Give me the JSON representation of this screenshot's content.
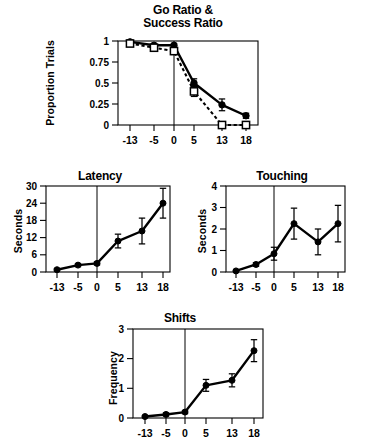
{
  "figure": {
    "background": "#ffffff",
    "ink_color": "#000000"
  },
  "chart_data": [
    {
      "id": "go-success-ratio",
      "type": "line",
      "title": "Go Ratio &\nSuccess Ratio",
      "title_line1": "Go Ratio &",
      "title_line2": "Success Ratio",
      "xlabel": "",
      "ylabel": "Proportion Trials",
      "x": [
        -13,
        -5,
        0,
        5,
        13,
        18
      ],
      "xtick_labels": [
        "-13",
        "-5",
        "0",
        "5",
        "13",
        "18"
      ],
      "ytick_labels": [
        "0",
        "0.25",
        "0.5",
        "0.75",
        "1"
      ],
      "ytick_values": [
        0,
        0.25,
        0.5,
        0.75,
        1
      ],
      "ylim": [
        0,
        1
      ],
      "grid": false,
      "legend": "none",
      "vertical_reference_x": 0,
      "series": [
        {
          "name": "Go Ratio",
          "marker": "filled-circle",
          "line": "solid",
          "values": [
            0.99,
            0.95,
            0.95,
            0.5,
            0.24,
            0.11
          ],
          "errors": [
            0.01,
            0.02,
            0.02,
            0.05,
            0.07,
            0.03
          ]
        },
        {
          "name": "Success Ratio",
          "marker": "open-square",
          "line": "dashed",
          "values": [
            0.97,
            0.92,
            0.88,
            0.4,
            0.0,
            0.0
          ],
          "errors": [
            0.02,
            0.03,
            0.04,
            0.06,
            0.0,
            0.0
          ]
        }
      ]
    },
    {
      "id": "latency",
      "type": "line",
      "title": "Latency",
      "xlabel": "",
      "ylabel": "Seconds",
      "x": [
        -13,
        -5,
        0,
        5,
        13,
        18
      ],
      "xtick_labels": [
        "-13",
        "-5",
        "0",
        "5",
        "13",
        "18"
      ],
      "ytick_labels": [
        "0",
        "6",
        "12",
        "18",
        "24",
        "30"
      ],
      "ytick_values": [
        0,
        6,
        12,
        18,
        24,
        30
      ],
      "ylim": [
        0,
        30
      ],
      "grid": false,
      "legend": "none",
      "vertical_reference_x": 0,
      "series": [
        {
          "name": "Latency",
          "marker": "filled-circle",
          "line": "solid",
          "values": [
            0.8,
            2.4,
            3.0,
            10.8,
            14.3,
            24.0
          ],
          "errors": [
            0.4,
            0.5,
            0.5,
            2.4,
            4.5,
            5.2
          ]
        }
      ]
    },
    {
      "id": "touching",
      "type": "line",
      "title": "Touching",
      "xlabel": "",
      "ylabel": "Seconds",
      "x": [
        -13,
        -5,
        0,
        5,
        13,
        18
      ],
      "xtick_labels": [
        "-13",
        "-5",
        "0",
        "5",
        "13",
        "18"
      ],
      "ytick_labels": [
        "0",
        "1",
        "2",
        "3",
        "4"
      ],
      "ytick_values": [
        0,
        1,
        2,
        3,
        4
      ],
      "ylim": [
        0,
        4
      ],
      "grid": false,
      "legend": "none",
      "vertical_reference_x": 0,
      "series": [
        {
          "name": "Touching",
          "marker": "filled-circle",
          "line": "solid",
          "values": [
            0.05,
            0.35,
            0.85,
            2.25,
            1.4,
            2.25
          ],
          "errors": [
            0.03,
            0.08,
            0.3,
            0.72,
            0.6,
            0.85
          ]
        }
      ]
    },
    {
      "id": "shifts",
      "type": "line",
      "title": "Shifts",
      "xlabel": "",
      "ylabel": "Frequency",
      "x": [
        -13,
        -5,
        0,
        5,
        13,
        18
      ],
      "xtick_labels": [
        "-13",
        "-5",
        "0",
        "5",
        "13",
        "18"
      ],
      "ytick_labels": [
        "0",
        "1",
        "2",
        "3"
      ],
      "ytick_values": [
        0,
        1,
        2,
        3
      ],
      "ylim": [
        0,
        3
      ],
      "grid": false,
      "legend": "none",
      "vertical_reference_x": 0,
      "series": [
        {
          "name": "Shifts",
          "marker": "filled-circle",
          "line": "solid",
          "values": [
            0.05,
            0.12,
            0.2,
            1.1,
            1.27,
            2.27
          ],
          "errors": [
            0.03,
            0.05,
            0.05,
            0.2,
            0.22,
            0.37
          ]
        }
      ]
    }
  ],
  "caption": {
    "clipped_text": ""
  }
}
